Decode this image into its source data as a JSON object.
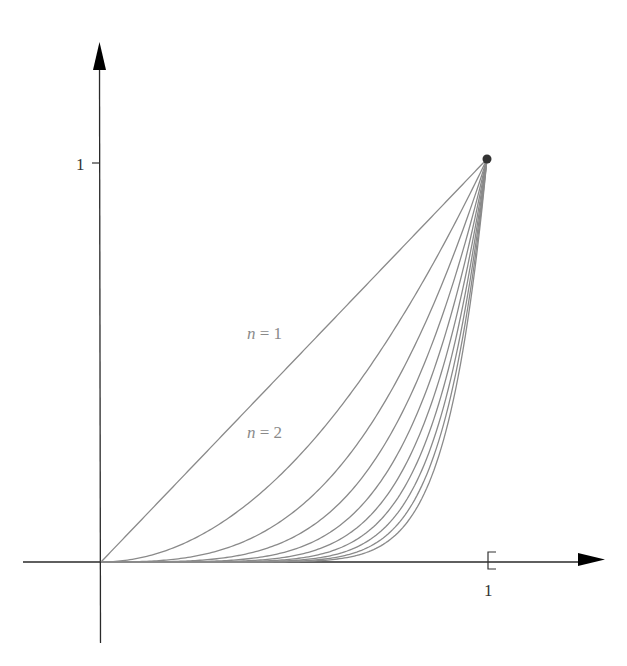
{
  "chart_data": {
    "type": "line",
    "title": "",
    "xlabel": "",
    "ylabel": "",
    "xlim": [
      0,
      1
    ],
    "ylim": [
      0,
      1
    ],
    "grid": false,
    "function": "y = x^n",
    "x_ticks": [
      {
        "value": 1,
        "label": "1"
      }
    ],
    "y_ticks": [
      {
        "value": 1,
        "label": "1"
      }
    ],
    "series": [
      {
        "name": "n = 1",
        "n": 1
      },
      {
        "name": "n = 2",
        "n": 2
      },
      {
        "name": "n = 3",
        "n": 3
      },
      {
        "name": "n = 4",
        "n": 4
      },
      {
        "name": "n = 5",
        "n": 5
      },
      {
        "name": "n = 6",
        "n": 6
      },
      {
        "name": "n = 7",
        "n": 7
      },
      {
        "name": "n = 8",
        "n": 8
      },
      {
        "name": "n = 9",
        "n": 9
      },
      {
        "name": "n = 10",
        "n": 10
      }
    ],
    "annotations": [
      {
        "text": "n = 1",
        "series": 1
      },
      {
        "text": "n = 2",
        "series": 2
      }
    ],
    "endpoint": {
      "x": 1,
      "y": 1,
      "marker": "filled-dot"
    },
    "x_end_marker": "bracket at x = 1"
  },
  "labels": {
    "y_tick_1": "1",
    "x_tick_1": "1",
    "n1_var": "n",
    "n1_eq": " = ",
    "n1_val": "1",
    "n2_var": "n",
    "n2_eq": " = ",
    "n2_val": "2"
  },
  "colors": {
    "axis": "#2a2a2a",
    "curve": "#8a8a8a",
    "arrow": "#000000",
    "endpoint": "#333333",
    "label": "#8a8a8a"
  },
  "geometry": {
    "origin_px": [
      101,
      562
    ],
    "unit_px": [
      386,
      403
    ]
  }
}
